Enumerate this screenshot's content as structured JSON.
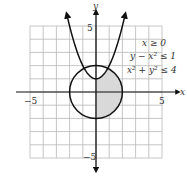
{
  "chart_data": {
    "type": "region",
    "title": "",
    "xlabel": "x",
    "ylabel": "y",
    "xlim": [
      -5,
      5
    ],
    "ylim": [
      -5,
      5
    ],
    "grid": true,
    "tick_labels": {
      "x_neg": "−5",
      "x_pos": "5",
      "y_pos": "5",
      "y_neg": "−5"
    },
    "inequalities": [
      "x ≥ 0",
      "y − x² ≤ 1",
      "x² + y² ≤ 4"
    ],
    "curves": [
      {
        "name": "parabola",
        "equation": "y = x² + 1",
        "arrows": true
      },
      {
        "name": "circle",
        "equation": "x² + y² = 4",
        "radius": 2
      }
    ],
    "shaded_region": "x ≥ 0 inside circle and below parabola",
    "colors": {
      "curve": "#111111",
      "grid": "#b8b8b8",
      "shade": "#d9d9d9",
      "axis": "#111111"
    }
  }
}
